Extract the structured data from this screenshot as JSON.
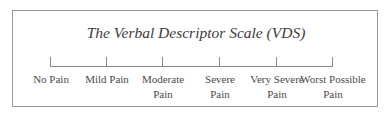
{
  "title": "The Verbal Descriptor Scale (VDS)",
  "scale": {
    "points": [
      {
        "x": 50,
        "line1": "No Pain",
        "line2": ""
      },
      {
        "x": 106,
        "line1": "Mild Pain",
        "line2": ""
      },
      {
        "x": 162,
        "line1": "Moderate",
        "line2": "Pain"
      },
      {
        "x": 219,
        "line1": "Severe",
        "line2": "Pain"
      },
      {
        "x": 276,
        "line1": "Very Severe",
        "line2": "Pain"
      },
      {
        "x": 332,
        "line1": "Worst Possible",
        "line2": "Pain"
      }
    ]
  }
}
